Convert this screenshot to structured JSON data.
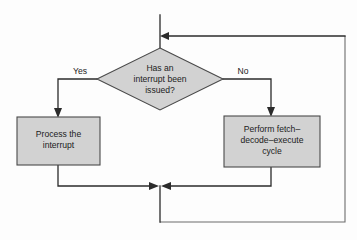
{
  "diagram": {
    "background_color": "#fdfdfd",
    "node_fill_color": "#d2d2d2",
    "node_stroke_color": "#4a4a4a",
    "connector_color": "#2b2b2b",
    "frame_color": "#6d6d6d",
    "decision": {
      "name": "interrupt-decision",
      "shape": "diamond",
      "lines": [
        "Has an",
        "interrupt been",
        "issued?"
      ],
      "text": "Has an interrupt been issued?"
    },
    "process_left": {
      "name": "process-interrupt-box",
      "shape": "rectangle",
      "lines": [
        "Process the",
        "interrupt"
      ],
      "text": "Process the interrupt"
    },
    "process_right": {
      "name": "fetch-decode-execute-box",
      "shape": "rectangle",
      "lines": [
        "Perform fetch–",
        "decode–execute",
        "cycle"
      ],
      "text": "Perform fetch–decode–execute cycle"
    },
    "branches": {
      "yes_label": "Yes",
      "no_label": "No"
    }
  }
}
